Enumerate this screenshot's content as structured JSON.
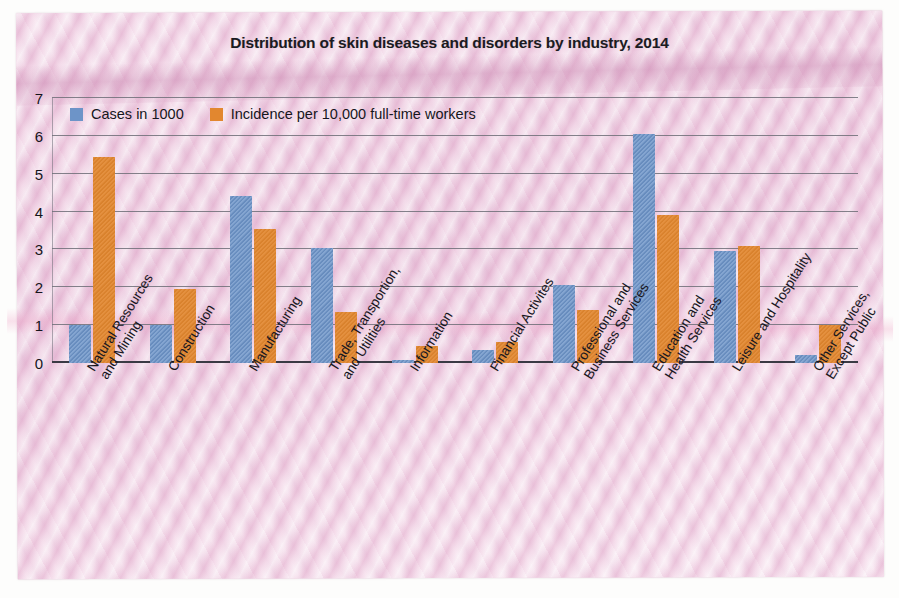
{
  "chart_data": {
    "type": "bar",
    "title": "Distribution of skin diseases and disorders by industry, 2014",
    "xlabel": "",
    "ylabel": "",
    "ylim": [
      0,
      7
    ],
    "yticks": [
      0,
      1,
      2,
      3,
      4,
      5,
      6,
      7
    ],
    "grid": true,
    "legend_position": "top-left inside plot",
    "categories": [
      "Natural Resources\nand Mining",
      "Construction",
      "Manufacturing",
      "Trade, Transportion,\nand Utilities",
      "Information",
      "Financial Activites",
      "Professional and\nBusiness Services",
      "Education and\nHealth Services",
      "Leisure and Hospitality",
      "Other Services,\nExcept Public"
    ],
    "series": [
      {
        "name": "Cases in 1000",
        "color": "#6d94c8",
        "values": [
          1.0,
          1.0,
          4.4,
          3.05,
          0.07,
          0.35,
          2.05,
          6.05,
          2.95,
          0.2
        ]
      },
      {
        "name": "Incidence per 10,000 full-time workers",
        "color": "#e2872f",
        "values": [
          5.45,
          1.95,
          3.55,
          1.35,
          0.45,
          0.55,
          1.4,
          3.9,
          3.1,
          1.0
        ]
      }
    ]
  },
  "colors": {
    "cases_blue": "#6d94c8",
    "incidence_orange": "#e2872f",
    "gridline": "#6e6e78",
    "axis": "#3a3a44",
    "text": "#16161c",
    "paper_background": "#eed4e3"
  }
}
